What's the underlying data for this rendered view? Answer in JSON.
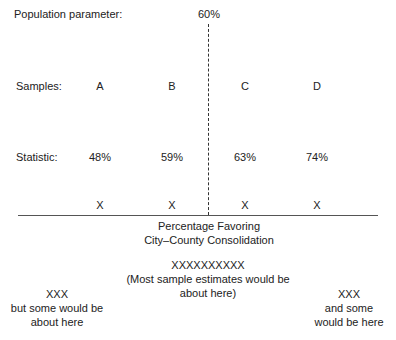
{
  "population": {
    "label": "Population parameter:",
    "value": "60%"
  },
  "samples": {
    "label": "Samples:",
    "items": [
      "A",
      "B",
      "C",
      "D"
    ]
  },
  "statistic": {
    "label": "Statistic:",
    "values": [
      "48%",
      "59%",
      "63%",
      "74%"
    ]
  },
  "marks": [
    "X",
    "X",
    "X",
    "X"
  ],
  "axis_title": {
    "line1": "Percentage Favoring",
    "line2": "City–County Consolidation"
  },
  "center_note": {
    "marks": "XXXXXXXXXX",
    "line1": "(Most sample estimates would be",
    "line2": "about here)"
  },
  "left_note": {
    "marks": "XXX",
    "line1": "but some would be",
    "line2": "about here"
  },
  "right_note": {
    "marks": "XXX",
    "line1": "and some",
    "line2": "would be here"
  }
}
